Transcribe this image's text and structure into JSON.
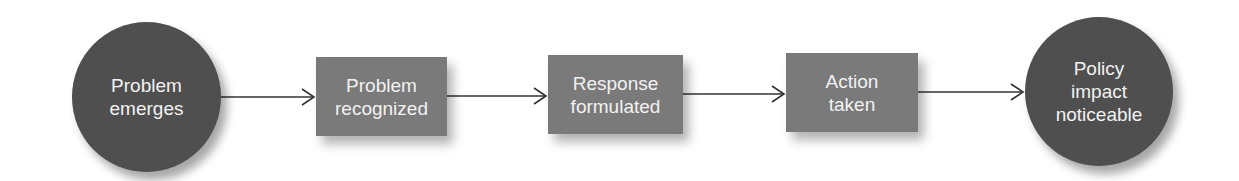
{
  "diagram": {
    "type": "flowchart",
    "direction": "left-to-right",
    "nodes": [
      {
        "id": "n1",
        "shape": "circle",
        "label": "Problem\nemerges"
      },
      {
        "id": "n2",
        "shape": "rectangle",
        "label": "Problem\nrecognized"
      },
      {
        "id": "n3",
        "shape": "rectangle",
        "label": "Response\nformulated"
      },
      {
        "id": "n4",
        "shape": "rectangle",
        "label": "Action\ntaken"
      },
      {
        "id": "n5",
        "shape": "circle",
        "label": "Policy\nimpact\nnoticeable"
      }
    ],
    "edges": [
      {
        "from": "n1",
        "to": "n2"
      },
      {
        "from": "n2",
        "to": "n3"
      },
      {
        "from": "n3",
        "to": "n4"
      },
      {
        "from": "n4",
        "to": "n5"
      }
    ],
    "colors": {
      "circle_fill": "#4f4f4f",
      "box_fill": "#7a7a7a",
      "text": "#f2f2f2",
      "arrow": "#333333",
      "background": "#ffffff"
    }
  }
}
